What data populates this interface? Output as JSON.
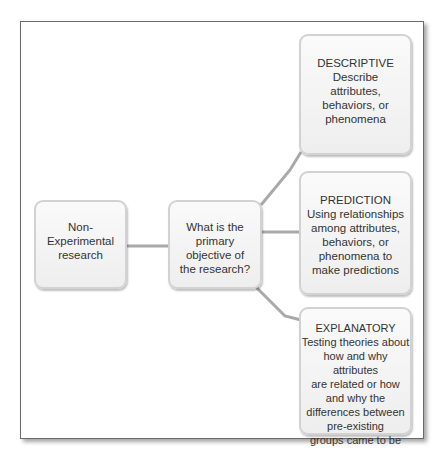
{
  "diagram": {
    "root": {
      "lines": [
        "Non-",
        "Experimental",
        "research"
      ]
    },
    "question": {
      "lines": [
        "What is the",
        "primary",
        "objective of",
        "the research?"
      ]
    },
    "outcomes": [
      {
        "title": "DESCRIPTIVE",
        "lines": [
          "Describe",
          "attributes,",
          "behaviors, or",
          "phenomena"
        ]
      },
      {
        "title": "PREDICTION",
        "lines": [
          "Using relationships",
          "among attributes,",
          "behaviors, or",
          "phenomena to",
          "make predictions"
        ]
      },
      {
        "title": "EXPLANATORY",
        "lines": [
          "Testing theories about",
          "how and why attributes",
          "are related or how",
          "and why the",
          "differences between",
          "pre-existing",
          "groups came to be"
        ]
      }
    ],
    "connector_color": "#a9a9a9",
    "box_border_color": "#d2d2d2"
  }
}
